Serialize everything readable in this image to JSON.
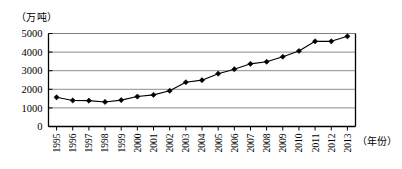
{
  "chart_data": {
    "type": "line",
    "title": "",
    "xlabel": "（年份）",
    "ylabel": "（万吨）",
    "ylim": [
      0,
      5000
    ],
    "yticks": [
      0,
      1000,
      2000,
      3000,
      4000,
      5000
    ],
    "grid": true,
    "legend": false,
    "marker": "diamond",
    "line_color": "#000000",
    "marker_color": "#000000",
    "grid_color": "#808080",
    "axis_color": "#000000",
    "categories": [
      "1995",
      "1996",
      "1997",
      "1998",
      "1999",
      "2000",
      "2001",
      "2002",
      "2003",
      "2004",
      "2005",
      "2006",
      "2007",
      "2008",
      "2009",
      "2010",
      "2011",
      "2012",
      "2013"
    ],
    "values": [
      1570,
      1400,
      1390,
      1320,
      1420,
      1610,
      1700,
      1920,
      2380,
      2490,
      2840,
      3080,
      3370,
      3480,
      3750,
      4060,
      4580,
      4580,
      4850
    ]
  }
}
